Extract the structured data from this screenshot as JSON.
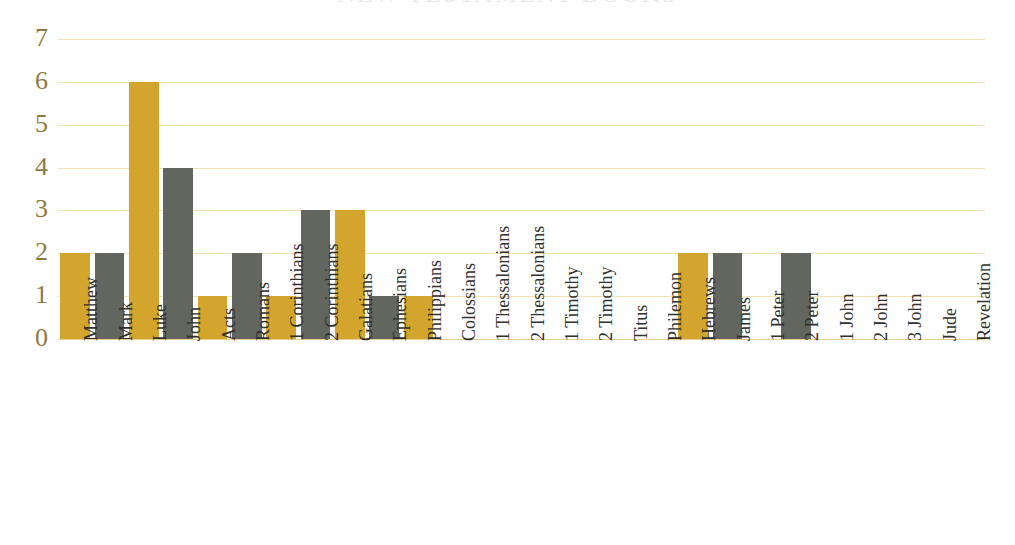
{
  "chart_data": {
    "type": "bar",
    "title": "NEW TESTAMENT BOOKS",
    "xlabel": "",
    "ylabel": "",
    "ylim": [
      0,
      7
    ],
    "ytick_labels": [
      "7",
      "6",
      "5",
      "4",
      "3",
      "2",
      "1",
      "0"
    ],
    "ytick_values": [
      7,
      6,
      5,
      4,
      3,
      2,
      1,
      0
    ],
    "grid": true,
    "legend": "none",
    "label_rotation": 90,
    "categories": [
      "Matthew",
      "Mark",
      "Luke",
      "John",
      "Acts",
      "Romans",
      "1 Corinthians",
      "2 Corinthians",
      "Galatians",
      "Ephesians",
      "Philippians",
      "Colossians",
      "1 Thessalonians",
      "2 Thessalonians",
      "1 Timothy",
      "2 Timothy",
      "Titus",
      "Philemon",
      "Hebrews",
      "James",
      "1 Peter",
      "2 Peter",
      "1 John",
      "2 John",
      "3 John",
      "Jude",
      "Revelation"
    ],
    "values": [
      2,
      2,
      6,
      4,
      1,
      2,
      1,
      3,
      3,
      1,
      1,
      0,
      0,
      0,
      0,
      0,
      0,
      0,
      2,
      2,
      0,
      2,
      0,
      0,
      0,
      0,
      0
    ],
    "bar_colors": [
      "#d3a52c",
      "#62665f",
      "#d3a52c",
      "#62665f",
      "#d3a52c",
      "#62665f",
      "#d3a52c",
      "#62665f",
      "#d3a52c",
      "#62665f",
      "#d3a52c",
      "#62665f",
      "#d3a52c",
      "#62665f",
      "#d3a52c",
      "#62665f",
      "#d3a52c",
      "#62665f",
      "#d3a52c",
      "#62665f",
      "#d3a52c",
      "#62665f",
      "#d3a52c",
      "#62665f",
      "#d3a52c",
      "#62665f",
      "#d3a52c"
    ]
  },
  "colors": {
    "bar_gold": "#d3a52c",
    "bar_gray": "#62665f",
    "gridline": "#f2e3b4",
    "axis_baseline": "#e8cf8f",
    "y_tick_text": "#8d7a42",
    "x_tick_text": "#30302f",
    "title_text": "#e9e9ec",
    "background": "#ffffff"
  }
}
